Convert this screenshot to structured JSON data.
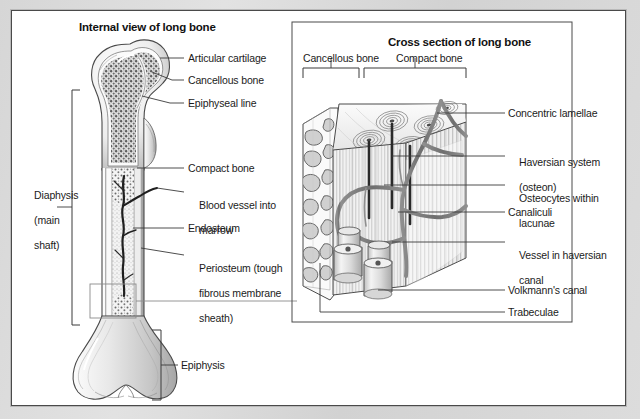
{
  "figure": {
    "background_color": "#d6d6d6",
    "page_color": "#ffffff",
    "line_color": "#3a3a3a"
  },
  "left_panel": {
    "title": "Internal view of long bone",
    "bracket_labels": [
      {
        "id": "diaphysis",
        "line1": "Diaphysis",
        "line2": "(main",
        "line3": "shaft)"
      },
      {
        "id": "epiphysis",
        "text": "Epiphysis"
      }
    ],
    "callouts": [
      {
        "id": "articular-cartilage",
        "text": "Articular cartilage"
      },
      {
        "id": "cancellous-bone",
        "text": "Cancellous bone"
      },
      {
        "id": "epiphyseal-line",
        "text": "Epiphyseal line"
      },
      {
        "id": "compact-bone",
        "text": "Compact bone"
      },
      {
        "id": "blood-vessel",
        "line1": "Blood vessel into",
        "line2": "marrow"
      },
      {
        "id": "endosteum",
        "text": "Endosteum"
      },
      {
        "id": "periosteum",
        "line1": "Periosteum (tough",
        "line2": "fibrous membrane",
        "line3": "sheath)"
      }
    ]
  },
  "right_panel": {
    "title": "Cross section of long bone",
    "bracket_labels": [
      {
        "id": "cancellous-bone",
        "text": "Cancellous bone"
      },
      {
        "id": "compact-bone",
        "text": "Compact bone"
      }
    ],
    "callouts": [
      {
        "id": "concentric-lamellae",
        "text": "Concentric lamellae"
      },
      {
        "id": "haversian-system",
        "line1": "Haversian system",
        "line2": "(osteon)"
      },
      {
        "id": "osteocytes",
        "line1": "Osteocytes within",
        "line2": "lacunae"
      },
      {
        "id": "canaliculi",
        "text": "Canaliculi"
      },
      {
        "id": "vessel-haversian-canal",
        "line1": "Vessel in haversian",
        "line2": "canal"
      },
      {
        "id": "volkmanns-canal",
        "text": "Volkmann's canal"
      },
      {
        "id": "trabeculae",
        "text": "Trabeculae"
      }
    ]
  }
}
